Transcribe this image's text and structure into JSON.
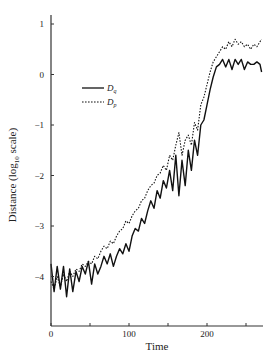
{
  "chart_data": {
    "type": "line",
    "title": "",
    "xlabel": "Time",
    "ylabel": "Distance (log10 scale)",
    "ylabel_parts": {
      "prefix": "Distance (log",
      "subscript": "10",
      "suffix": " scale)"
    },
    "xlim": [
      0,
      275
    ],
    "ylim": [
      -5,
      1.2
    ],
    "x_ticks": [
      0,
      50,
      100,
      150,
      200,
      250
    ],
    "x_tick_labels": [
      "0",
      "",
      "100",
      "",
      "200",
      ""
    ],
    "y_ticks": [
      1,
      0,
      -1,
      -2,
      -3,
      -4
    ],
    "y_tick_labels": [
      "1",
      "0",
      "−1",
      "−2",
      "−3",
      "−4"
    ],
    "grid": false,
    "legend_position": "upper-left-inside",
    "series": [
      {
        "name": "D_q",
        "label_main": "D",
        "label_sub": "q",
        "style": "solid",
        "color": "#111111",
        "x": [
          0,
          4,
          8,
          12,
          16,
          20,
          24,
          28,
          32,
          36,
          40,
          44,
          48,
          52,
          56,
          60,
          64,
          68,
          72,
          76,
          80,
          84,
          88,
          92,
          96,
          100,
          104,
          108,
          112,
          116,
          120,
          124,
          128,
          132,
          136,
          140,
          144,
          148,
          152,
          156,
          160,
          164,
          168,
          172,
          176,
          180,
          184,
          188,
          192,
          196,
          200,
          204,
          208,
          212,
          216,
          220,
          224,
          228,
          232,
          236,
          240,
          244,
          248,
          252,
          256,
          260,
          264,
          268,
          270
        ],
        "values": [
          -3.75,
          -4.3,
          -3.8,
          -4.25,
          -3.8,
          -4.4,
          -3.85,
          -4.3,
          -3.9,
          -4.1,
          -3.8,
          -3.95,
          -3.7,
          -4.15,
          -3.75,
          -3.95,
          -3.8,
          -3.6,
          -3.75,
          -3.55,
          -3.8,
          -3.6,
          -3.45,
          -3.55,
          -3.35,
          -3.5,
          -3.2,
          -3.05,
          -3.1,
          -2.85,
          -2.95,
          -2.7,
          -2.5,
          -2.65,
          -2.3,
          -2.45,
          -2.1,
          -2.25,
          -1.9,
          -2.3,
          -1.6,
          -2.4,
          -1.7,
          -2.2,
          -1.5,
          -1.9,
          -1.3,
          -1.6,
          -1.0,
          -0.9,
          -0.6,
          -0.3,
          -0.05,
          0.15,
          0.2,
          0.3,
          0.15,
          0.3,
          0.1,
          0.3,
          0.2,
          0.3,
          0.1,
          0.25,
          0.2,
          0.2,
          0.25,
          0.2,
          0.05
        ]
      },
      {
        "name": "D_p",
        "label_main": "D",
        "label_sub": "p",
        "style": "dotted",
        "color": "#111111",
        "x": [
          0,
          4,
          8,
          12,
          16,
          20,
          24,
          28,
          32,
          36,
          40,
          44,
          48,
          52,
          56,
          60,
          64,
          68,
          72,
          76,
          80,
          84,
          88,
          92,
          96,
          100,
          104,
          108,
          112,
          116,
          120,
          124,
          128,
          132,
          136,
          140,
          144,
          148,
          152,
          156,
          160,
          164,
          168,
          172,
          176,
          180,
          184,
          188,
          192,
          196,
          200,
          204,
          208,
          212,
          216,
          220,
          224,
          228,
          232,
          236,
          240,
          244,
          248,
          252,
          256,
          260,
          264,
          268,
          270
        ],
        "values": [
          -4.1,
          -4.25,
          -4.0,
          -4.2,
          -3.95,
          -4.1,
          -3.9,
          -4.0,
          -3.85,
          -3.9,
          -3.75,
          -3.8,
          -3.7,
          -3.75,
          -3.6,
          -3.65,
          -3.5,
          -3.4,
          -3.45,
          -3.3,
          -3.35,
          -3.2,
          -3.1,
          -3.05,
          -2.9,
          -2.95,
          -2.8,
          -2.7,
          -2.65,
          -2.5,
          -2.45,
          -2.3,
          -2.2,
          -2.15,
          -2.0,
          -1.95,
          -1.8,
          -1.9,
          -1.6,
          -1.7,
          -1.4,
          -1.15,
          -1.6,
          -1.3,
          -1.2,
          -1.4,
          -0.95,
          -1.1,
          -0.6,
          -0.45,
          -0.2,
          0.05,
          0.25,
          0.35,
          0.45,
          0.55,
          0.5,
          0.65,
          0.55,
          0.7,
          0.6,
          0.65,
          0.55,
          0.6,
          0.5,
          0.6,
          0.55,
          0.65,
          0.7
        ]
      }
    ]
  }
}
